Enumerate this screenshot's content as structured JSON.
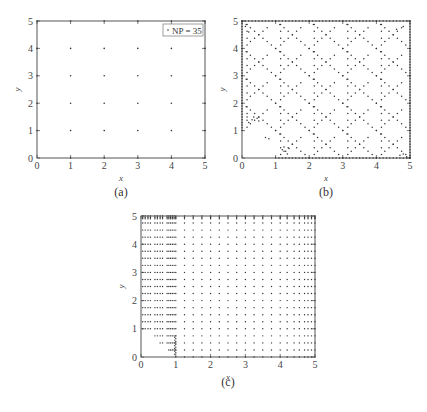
{
  "figure": {
    "captions": {
      "a": "(a)",
      "b": "(b)",
      "c": "(c)"
    }
  },
  "chart_data": [
    {
      "id": "a",
      "type": "scatter",
      "title": "",
      "xlabel": "x",
      "ylabel": "y",
      "xlim": [
        0,
        5
      ],
      "ylim": [
        0,
        5
      ],
      "xticks": [
        "0",
        "1",
        "2",
        "3",
        "4",
        "5"
      ],
      "yticks": [
        "0",
        "1",
        "2",
        "3",
        "4",
        "5"
      ],
      "grid": false,
      "legend": {
        "position": "upper right",
        "entries": [
          "NP = 35"
        ]
      },
      "points": "uniform grid: x in {0,1,2,3,4,5}, y in {0,1,2,3,4,5} (35 nodes, origin excluded)",
      "x_nodes": [
        0,
        1,
        2,
        3,
        4,
        5
      ],
      "y_nodes": [
        0,
        1,
        2,
        3,
        4,
        5
      ]
    },
    {
      "id": "b",
      "type": "scatter",
      "title": "",
      "xlabel": "x",
      "ylabel": "y",
      "xlim": [
        0,
        5
      ],
      "ylim": [
        0,
        5
      ],
      "xticks": [
        "0",
        "1",
        "2",
        "3",
        "4",
        "5"
      ],
      "yticks": [
        "0",
        "1",
        "2",
        "3",
        "4",
        "5"
      ],
      "grid": false,
      "points": "dense scattered nodes forming diagonal X/diamond patterns, empty triangle near origin below line from (0,1) to (1,0), clusters near (0.3,1.4) and (1.3,0.3)"
    },
    {
      "id": "c",
      "type": "scatter",
      "title": "",
      "xlabel": "x",
      "ylabel": "y",
      "xlim": [
        0,
        5
      ],
      "ylim": [
        0,
        5
      ],
      "xticks": [
        "0",
        "1",
        "2",
        "3",
        "4",
        "5"
      ],
      "yticks": [
        "0",
        "1",
        "2",
        "3",
        "4",
        "5"
      ],
      "grid": false,
      "points": "structured grid: rows every ~0.25 in y, columns dense near x=0-1 and near x=5, sparser in middle; empty triangular region near origin below line from (0,1) to (1,0)"
    }
  ]
}
